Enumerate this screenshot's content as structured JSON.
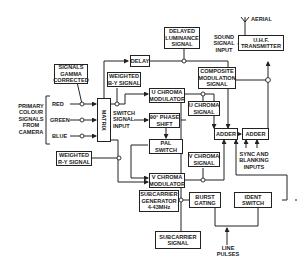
{
  "diagram": {
    "blocks": {
      "signals_gamma": [
        "SIGNALS",
        "GAMMA",
        "CORRECTED"
      ],
      "delay": [
        "DELAY"
      ],
      "delayed_luminance": [
        "DELAYED",
        "LUMINANCE",
        "SIGNAL"
      ],
      "weighted_by": [
        "WEIGHTED",
        "B-Y SIGNAL"
      ],
      "matrix": [
        "MATRIX"
      ],
      "u_chroma_mod": [
        "U CHROMA",
        "MODULATOR"
      ],
      "phase_shift": [
        "90° PHASE",
        "SHIFT"
      ],
      "pal_switch": [
        "PAL",
        "SWITCH"
      ],
      "v_chroma_mod": [
        "V CHROMA",
        "MODULATOR"
      ],
      "weighted_ry": [
        "WEIGHTED",
        "R-Y SIGNAL"
      ],
      "subcarrier_gen": [
        "SUBCARRIER",
        "GENERATOR",
        "4·43MHz"
      ],
      "u_chroma_signal": [
        "U CHROMA",
        "SIGNAL"
      ],
      "v_chroma_signal": [
        "V CHROMA",
        "SIGNAL"
      ],
      "composite": [
        "COMPOSITE",
        "MODULATION",
        "SIGNAL"
      ],
      "adder1": [
        "ADDER"
      ],
      "adder2": [
        "ADDER"
      ],
      "uhf": [
        "U.H.F.",
        "TRANSMITTER"
      ],
      "burst_gating": [
        "BURST",
        "GATING"
      ],
      "ident_switch": [
        "IDENT",
        "SWITCH"
      ],
      "subcarrier_signal": [
        "SUBCARRIER",
        "SIGNAL"
      ]
    },
    "labels": {
      "primary": [
        "PRIMARY",
        "COLOUR",
        "SIGNALS",
        "FROM",
        "CAMERA"
      ],
      "red": "RED",
      "green": "GREEN",
      "blue": "BLUE",
      "switch_signal": [
        "SWITCH",
        "SIGNAL",
        "INPUT"
      ],
      "sound": [
        "SOUND",
        "SIGNAL",
        "INPUT"
      ],
      "aerial": "AERIAL",
      "sync": [
        "SYNC AND",
        "BLANKING",
        "INPUTS"
      ],
      "line_pulses": [
        "LINE",
        "PULSES"
      ]
    }
  }
}
